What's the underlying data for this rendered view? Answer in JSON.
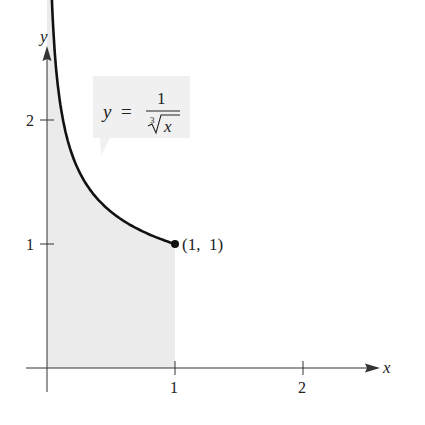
{
  "chart_data": {
    "type": "area",
    "title": "",
    "function_label": {
      "lhs": "y",
      "eq": "=",
      "numerator": "1",
      "radical_index": "3",
      "radicand": "x"
    },
    "xlabel": "x",
    "ylabel": "y",
    "x_ticks": [
      "1",
      "2"
    ],
    "y_ticks": [
      "1",
      "2"
    ],
    "xlim": [
      0,
      2.5
    ],
    "ylim": [
      0,
      2.5
    ],
    "grid": false,
    "shaded_region": {
      "from_x": 0,
      "to_x": 1,
      "under": "y = 1/cbrt(x)"
    },
    "point": {
      "x": 1,
      "y": 1,
      "label": "(1,  1)"
    },
    "series": [
      {
        "name": "y = 1/cbrt(x)",
        "x": [
          0.066,
          0.1,
          0.15,
          0.2,
          0.3,
          0.4,
          0.5,
          0.6,
          0.7,
          0.8,
          0.9,
          1.0
        ],
        "values": [
          2.47,
          2.15,
          1.88,
          1.71,
          1.49,
          1.36,
          1.26,
          1.19,
          1.13,
          1.08,
          1.04,
          1.0
        ]
      }
    ]
  },
  "colors": {
    "curve": "#111111",
    "fill": "#ebebeb",
    "axis": "#333333",
    "callout": "#f0f0f0"
  }
}
